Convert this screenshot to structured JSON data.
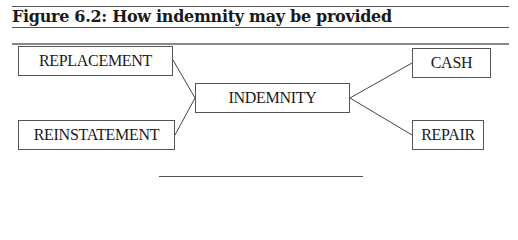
{
  "figure": {
    "title": "Figure 6.2: How indemnity may be provided"
  },
  "diagram": {
    "center": {
      "label": "INDEMNITY"
    },
    "left_nodes": [
      {
        "label": "REPLACEMENT"
      },
      {
        "label": "REINSTATEMENT"
      }
    ],
    "right_nodes": [
      {
        "label": "CASH"
      },
      {
        "label": "REPAIR"
      }
    ]
  }
}
